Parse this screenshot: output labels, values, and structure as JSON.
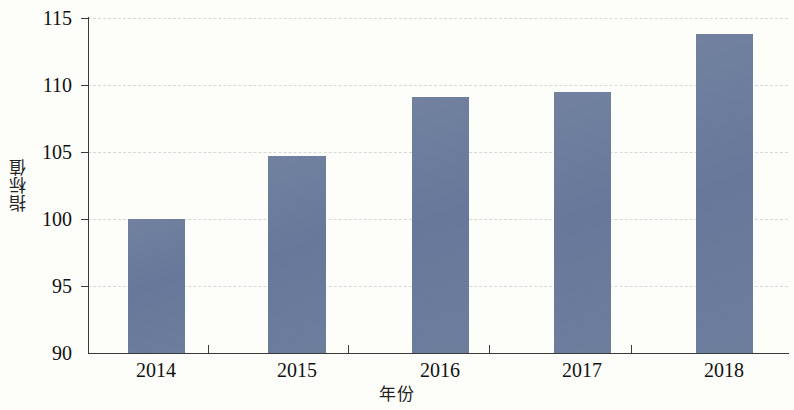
{
  "chart_data": {
    "type": "bar",
    "title": "",
    "subtitle": "",
    "xlabel": "年份",
    "ylabel": "指标值",
    "categories": [
      "2014",
      "2015",
      "2016",
      "2017",
      "2018"
    ],
    "values": [
      100.0,
      104.7,
      109.1,
      109.5,
      113.8
    ],
    "series": [
      {
        "name": "指标值",
        "values": [
          100.0,
          104.7,
          109.1,
          109.5,
          113.8
        ],
        "color": "#6c7c9c"
      }
    ],
    "ylim": [
      90,
      115
    ],
    "yticks": [
      90,
      95,
      100,
      105,
      110,
      115
    ],
    "ytick_labels": [
      "90",
      "95",
      "100",
      "105",
      "110",
      "115"
    ],
    "xtick_labels": [
      "2014",
      "2015",
      "2016",
      "2017",
      "2018"
    ],
    "grid": "horizontal-dashed",
    "legend": "none",
    "annotations": []
  },
  "axes": {
    "y_title": "指标值",
    "x_title": "年份",
    "y_labels": [
      "115",
      "110",
      "105",
      "100",
      "95",
      "90"
    ],
    "x_labels": [
      "2014",
      "2015",
      "2016",
      "2017",
      "2018"
    ]
  },
  "colors": {
    "bar": "#6c7c9c",
    "axis": "#3a3a3a",
    "grid": "#d8d8d8",
    "background": "#fdfdfa",
    "text": "#111111"
  }
}
